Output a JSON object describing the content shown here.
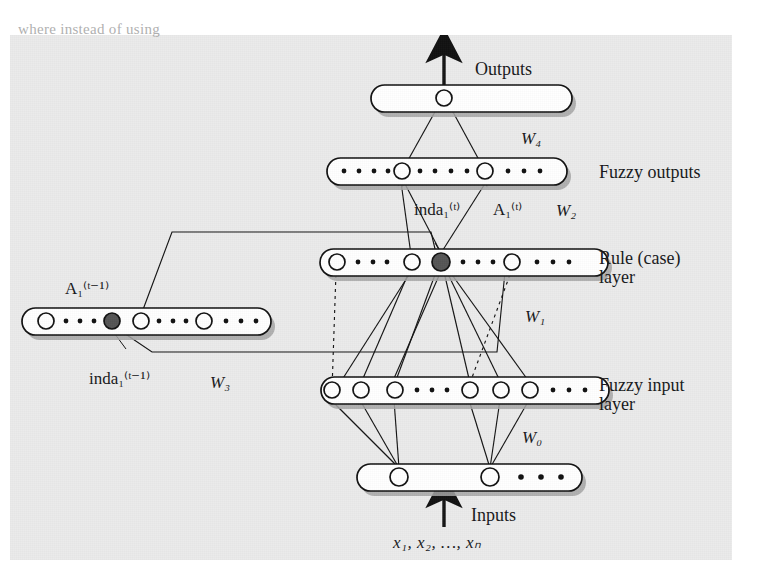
{
  "page": {
    "cropped_text_above_figure": "where instead of using"
  },
  "figure": {
    "background_color": "#ebebeb",
    "node_fill": "#ffffff",
    "node_stroke": "#1a1a1a",
    "highlight_node_fill": "#555555",
    "capsule_fill": "#ffffff",
    "capsule_stroke": "#1a1a1a",
    "shadow_color": "#9a9a9a"
  },
  "labels": {
    "outputs": "Outputs",
    "inputs": "Inputs",
    "input_vector": "x₁, x₂, …, xₙ",
    "fuzzy_outputs": "Fuzzy outputs",
    "rule_case_layer_line1": "Rule (case)",
    "rule_case_layer_line2": "layer",
    "fuzzy_input_layer_line1": "Fuzzy input",
    "fuzzy_input_layer_line2": "layer",
    "w0": "W₀",
    "w1": "W₁",
    "w2": "W₂",
    "w3": "W₃",
    "w4": "W₄",
    "inda_t": "inda₁⁽ᵗ⁾",
    "a_t": "A₁⁽ᵗ⁾",
    "inda_t_minus_1": "inda₁⁽ᵗ⁻¹⁾",
    "a_t_minus_1": "A₁⁽ᵗ⁻¹⁾"
  },
  "layers": [
    {
      "name": "output-layer",
      "label": "Outputs",
      "capsule": {
        "x": 371,
        "y": 85,
        "w": 201,
        "h": 27
      },
      "nodes": [
        {
          "cx": 444,
          "cy": 98,
          "r": 8,
          "filled": false
        }
      ],
      "trailing_dots": 0
    },
    {
      "name": "fuzzy-output-layer",
      "label": "Fuzzy outputs",
      "capsule": {
        "x": 327,
        "y": 158,
        "w": 240,
        "h": 27
      },
      "nodes": [
        {
          "cx": 402,
          "cy": 171,
          "r": 8,
          "filled": false
        },
        {
          "cx": 485,
          "cy": 171,
          "r": 8,
          "filled": false
        }
      ],
      "leading_dots": 4,
      "middle_dots": 4,
      "trailing_dots": 3
    },
    {
      "name": "rule-case-layer",
      "label": "Rule (case) layer",
      "capsule": {
        "x": 320,
        "y": 249,
        "w": 288,
        "h": 27
      },
      "nodes": [
        {
          "cx": 337,
          "cy": 262,
          "r": 8,
          "filled": false
        },
        {
          "cx": 412,
          "cy": 262,
          "r": 8,
          "filled": false
        },
        {
          "cx": 441,
          "cy": 262,
          "r": 9,
          "filled": true
        },
        {
          "cx": 512,
          "cy": 262,
          "r": 8,
          "filled": false
        }
      ],
      "dots_groups": [
        4,
        4,
        3
      ]
    },
    {
      "name": "previous-rule-layer",
      "label": "A₁⁽ᵗ⁻¹⁾",
      "capsule": {
        "x": 22,
        "y": 308,
        "w": 249,
        "h": 27
      },
      "nodes": [
        {
          "cx": 46,
          "cy": 321,
          "r": 8,
          "filled": false
        },
        {
          "cx": 112,
          "cy": 321,
          "r": 8,
          "filled": true
        },
        {
          "cx": 141,
          "cy": 321,
          "r": 8,
          "filled": false
        },
        {
          "cx": 204,
          "cy": 321,
          "r": 8,
          "filled": false
        }
      ],
      "dots_groups": [
        4,
        4,
        3
      ]
    },
    {
      "name": "fuzzy-input-layer",
      "label": "Fuzzy input layer",
      "capsule": {
        "x": 321,
        "y": 377,
        "w": 288,
        "h": 27
      },
      "nodes": [
        {
          "cx": 332,
          "cy": 390,
          "r": 8,
          "filled": false
        },
        {
          "cx": 361,
          "cy": 390,
          "r": 8,
          "filled": false
        },
        {
          "cx": 395,
          "cy": 390,
          "r": 8,
          "filled": false
        },
        {
          "cx": 470,
          "cy": 390,
          "r": 8,
          "filled": false
        },
        {
          "cx": 501,
          "cy": 390,
          "r": 8,
          "filled": false
        },
        {
          "cx": 530,
          "cy": 390,
          "r": 8,
          "filled": false
        }
      ],
      "middle_dots": 4,
      "trailing_dots": 3
    },
    {
      "name": "input-layer",
      "label": "Inputs",
      "capsule": {
        "x": 357,
        "y": 464,
        "w": 225,
        "h": 27
      },
      "nodes": [
        {
          "cx": 399,
          "cy": 477,
          "r": 9,
          "filled": false
        },
        {
          "cx": 490,
          "cy": 477,
          "r": 9,
          "filled": false
        }
      ],
      "trailing_dots": 3
    }
  ],
  "weights": [
    {
      "name": "W₀",
      "between": "input-layer → fuzzy-input-layer"
    },
    {
      "name": "W₁",
      "between": "fuzzy-input-layer → rule-case-layer"
    },
    {
      "name": "W₂",
      "between": "rule-case-layer → fuzzy-output-layer"
    },
    {
      "name": "W₃",
      "between": "previous-rule-layer feedback"
    },
    {
      "name": "W₄",
      "between": "fuzzy-output-layer → output-layer"
    }
  ]
}
